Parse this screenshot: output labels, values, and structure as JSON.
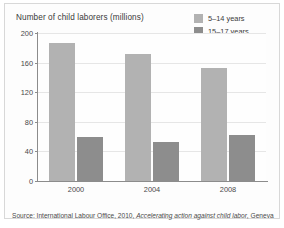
{
  "chart_data": {
    "type": "bar",
    "title": "Number of child laborers (millions)",
    "xlabel": "",
    "ylabel": "",
    "categories": [
      "2000",
      "2004",
      "2008"
    ],
    "series": [
      {
        "name": "5–14 years",
        "color": "#b2b2b2",
        "values": [
          186,
          171,
          153
        ]
      },
      {
        "name": "15–17 years",
        "color": "#8d8d8d",
        "values": [
          59,
          53,
          62
        ]
      }
    ],
    "ylim": [
      0,
      200
    ],
    "yticks": [
      0,
      40,
      80,
      120,
      160,
      200
    ],
    "ytick_labels": [
      "0",
      "40",
      "80",
      "120",
      "160",
      "200"
    ],
    "grid": true,
    "legend_position": "top-right"
  },
  "source": {
    "prefix": "Source: International Labour Office, 2010, ",
    "title": "Accelerating action against child labor",
    "suffix": ", Geneva"
  }
}
